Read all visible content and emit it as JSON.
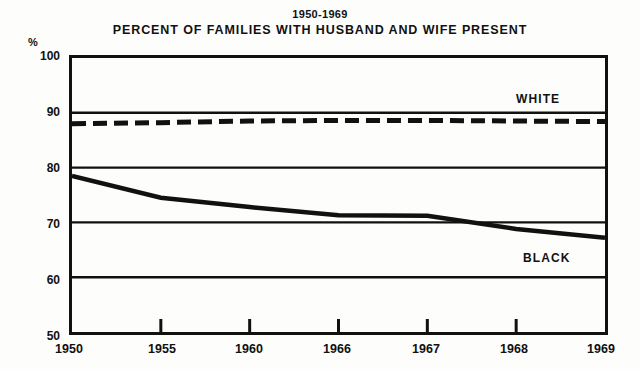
{
  "figure": {
    "title_line_1": "1950-1969",
    "title_line_2": "PERCENT OF FAMILIES WITH HUSBAND AND WIFE PRESENT",
    "axis_unit": "%"
  },
  "chart_data": {
    "type": "line",
    "title": "PERCENT OF FAMILIES WITH HUSBAND AND WIFE PRESENT",
    "subtitle": "1950-1969",
    "xlabel": "",
    "ylabel": "%",
    "ylim": [
      50,
      100
    ],
    "yticks": [
      100,
      90,
      80,
      70,
      60,
      50
    ],
    "grid": "horizontal",
    "legend_position": "inline-right",
    "categories": [
      "1950",
      "1955",
      "1960",
      "1966",
      "1967",
      "1968",
      "1969"
    ],
    "series": [
      {
        "name": "WHITE",
        "style": "dashed",
        "color": "#111111",
        "values": [
          88.0,
          88.2,
          88.5,
          88.6,
          88.6,
          88.5,
          88.4
        ]
      },
      {
        "name": "BLACK",
        "style": "solid",
        "color": "#111111",
        "values": [
          78.5,
          74.5,
          72.8,
          71.3,
          71.2,
          68.8,
          67.2
        ]
      }
    ]
  },
  "y_axis": {
    "ticks": [
      {
        "label": "100",
        "value": 100
      },
      {
        "label": "90",
        "value": 90
      },
      {
        "label": "80",
        "value": 80
      },
      {
        "label": "70",
        "value": 70
      },
      {
        "label": "60",
        "value": 60
      },
      {
        "label": "50",
        "value": 50
      }
    ]
  },
  "x_axis": {
    "ticks": [
      {
        "label": "1950"
      },
      {
        "label": "1955"
      },
      {
        "label": "1960"
      },
      {
        "label": "1966"
      },
      {
        "label": "1967"
      },
      {
        "label": "1968"
      },
      {
        "label": "1969"
      }
    ]
  },
  "series_labels": {
    "white": "WHITE",
    "black": "BLACK"
  }
}
